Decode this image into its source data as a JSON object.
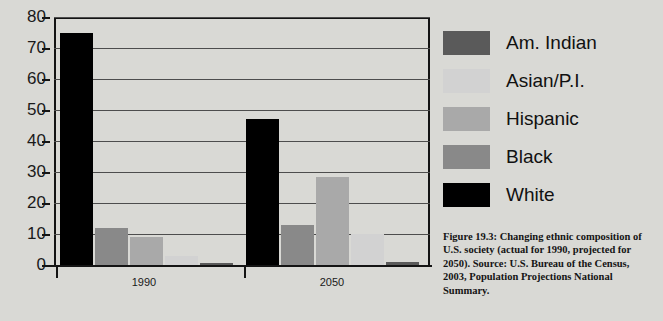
{
  "figure": {
    "caption": "Figure 19.3: Changing ethnic composition of U.S. society (actual for 1990, projected for 2050). Source: U.S. Bureau of the Census, 2003, Population Projections National Summary."
  },
  "legend": {
    "position": "right",
    "items": [
      {
        "label": "Am. Indian",
        "color": "#5a5a5a"
      },
      {
        "label": "Asian/P.I.",
        "color": "#d2d2d2"
      },
      {
        "label": "Hispanic",
        "color": "#a9a9a9"
      },
      {
        "label": "Black",
        "color": "#898989"
      },
      {
        "label": "White",
        "color": "#000000"
      }
    ]
  },
  "axis": {
    "y_ticks": [
      "80",
      "70",
      "60",
      "50",
      "40",
      "30",
      "20",
      "10",
      "0"
    ],
    "x_categories": [
      "1990",
      "2050"
    ]
  },
  "chart_data": {
    "type": "bar",
    "title": "",
    "xlabel": "",
    "ylabel": "",
    "ylim": [
      0,
      80
    ],
    "ytick_step": 10,
    "grid": true,
    "legend_position": "right",
    "categories": [
      "1990",
      "2050"
    ],
    "series": [
      {
        "name": "White",
        "color": "#000000",
        "values": [
          75,
          47
        ]
      },
      {
        "name": "Black",
        "color": "#898989",
        "values": [
          12,
          13
        ]
      },
      {
        "name": "Hispanic",
        "color": "#a9a9a9",
        "values": [
          9,
          28.5
        ]
      },
      {
        "name": "Asian/P.I.",
        "color": "#d2d2d2",
        "values": [
          3,
          10
        ]
      },
      {
        "name": "Am. Indian",
        "color": "#5a5a5a",
        "values": [
          0.8,
          1
        ]
      }
    ],
    "bar_order_left_to_right": [
      "White",
      "Black",
      "Hispanic",
      "Asian/P.I.",
      "Am. Indian"
    ],
    "annotations": []
  }
}
